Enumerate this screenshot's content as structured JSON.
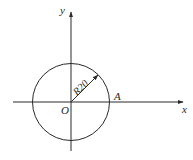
{
  "diagram": {
    "type": "coordinate-circle",
    "colors": {
      "stroke": "#2a2a2a",
      "background": "#ffffff"
    },
    "axes": {
      "x_label": "x",
      "y_label": "y"
    },
    "origin": {
      "label": "O"
    },
    "point": {
      "label": "A"
    },
    "circle": {
      "radius_label": "R20"
    }
  }
}
